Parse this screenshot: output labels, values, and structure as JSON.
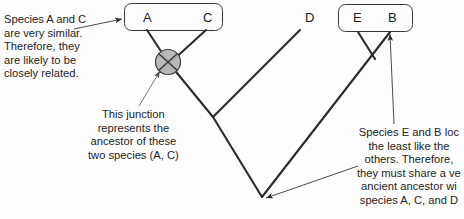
{
  "diagram": {
    "background_color": "#fdfdfd",
    "line_color": "#2b2b2b",
    "text_color": "#232323",
    "junction_fill": "#b5b5b5"
  },
  "taxa": [
    {
      "id": "A",
      "label": "A",
      "x": 143,
      "y": 18
    },
    {
      "id": "C",
      "label": "C",
      "x": 203,
      "y": 18
    },
    {
      "id": "D",
      "label": "D",
      "x": 305,
      "y": 18
    },
    {
      "id": "E",
      "label": "E",
      "x": 353,
      "y": 18
    },
    {
      "id": "B",
      "label": "B",
      "x": 388,
      "y": 18
    }
  ],
  "boxes": [
    {
      "name": "box-ac",
      "members": "A, C",
      "x": 124,
      "y": 3,
      "w": 98,
      "h": 27
    },
    {
      "name": "box-eb",
      "members": "E, B",
      "x": 338,
      "y": 4,
      "w": 74,
      "h": 27
    }
  ],
  "annotations": {
    "left": {
      "name": "annotation-species-a-c",
      "lines": [
        "Species A and C",
        "are very similar.",
        "Therefore, they",
        "are likely to be",
        "closely related."
      ],
      "points_to": "box-ac"
    },
    "middle": {
      "name": "annotation-junction",
      "lines": [
        "This junction",
        "represents the",
        "ancestor of these",
        "two species (A, C)"
      ],
      "points_to": "junction-ac"
    },
    "right": {
      "name": "annotation-species-e-b",
      "lines": [
        "Species E and B loc",
        "the least like the",
        "others. Therefore,",
        "they must share a ve",
        "ancient ancestor wi",
        "species A, C, and D"
      ],
      "points_to": "root-node"
    }
  },
  "nodes": [
    {
      "name": "junction-ac",
      "x": 168,
      "y": 62,
      "r": 13,
      "fill": "#b5b5b5"
    },
    {
      "name": "junction-acd",
      "x": 213,
      "y": 117
    },
    {
      "name": "junction-eb",
      "x": 372,
      "y": 55
    },
    {
      "name": "root-node",
      "x": 262,
      "y": 197
    }
  ]
}
